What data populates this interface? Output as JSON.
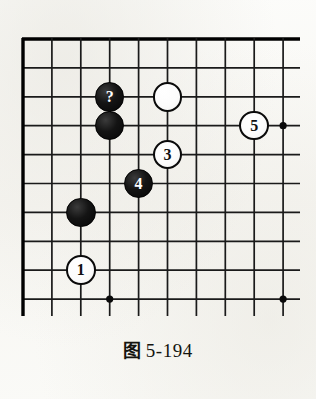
{
  "figure": {
    "caption_label": "图",
    "caption_number": "5-194",
    "caption_full": "图 5-194"
  },
  "board": {
    "type": "go-board-diagram",
    "description": "Go (weiqi) joseki diagram, upper-left corner of the board, cropped at right and bottom",
    "columns": 10,
    "rows": 10,
    "origin_x": 23,
    "origin_y": 39,
    "spacing": 28.9,
    "edge_top": true,
    "edge_left": true,
    "edge_right": false,
    "edge_bottom": false,
    "line_color": "#1a1a1a",
    "edge_line_color": "#000000",
    "board_color": "#fbfbf8",
    "star_points": [
      {
        "col": 3,
        "row": 3
      },
      {
        "col": 3,
        "row": 9
      },
      {
        "col": 9,
        "row": 3
      },
      {
        "col": 9,
        "row": 9
      }
    ],
    "stones": [
      {
        "id": "black-question",
        "color": "black",
        "col": 3,
        "row": 2,
        "label": "?",
        "name": "stone-black-question"
      },
      {
        "id": "black-plain-upper",
        "color": "black",
        "col": 3,
        "row": 3,
        "label": "",
        "name": "stone-black-plain-upper"
      },
      {
        "id": "white-plain",
        "color": "white",
        "col": 5,
        "row": 2,
        "label": "",
        "name": "stone-white-plain"
      },
      {
        "id": "white-5",
        "color": "white",
        "col": 8,
        "row": 3,
        "label": "5",
        "name": "stone-white-5"
      },
      {
        "id": "white-3",
        "color": "white",
        "col": 5,
        "row": 4,
        "label": "3",
        "name": "stone-white-3"
      },
      {
        "id": "black-4",
        "color": "black",
        "col": 4,
        "row": 5,
        "label": "4",
        "name": "stone-black-4"
      },
      {
        "id": "black-plain-lower",
        "color": "black",
        "col": 2,
        "row": 6,
        "label": "",
        "name": "stone-black-plain-lower"
      },
      {
        "id": "white-1",
        "color": "white",
        "col": 2,
        "row": 8,
        "label": "1",
        "name": "stone-white-1"
      }
    ]
  }
}
